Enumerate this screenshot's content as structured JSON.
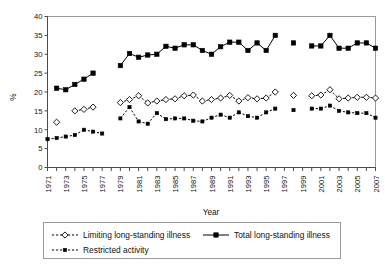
{
  "chart_data": {
    "type": "line",
    "title": "",
    "xlabel": "Year",
    "ylabel": "%",
    "ylim": [
      0,
      40
    ],
    "ytick_step": 5,
    "yticks": [
      0,
      5,
      10,
      15,
      20,
      25,
      30,
      35,
      40
    ],
    "xlim": [
      1971,
      2007
    ],
    "xtick_step": 1,
    "xtick_labels": [
      "1971",
      "1973",
      "1975",
      "1977",
      "1979",
      "1981",
      "1983",
      "1985",
      "1987",
      "1989",
      "1991",
      "1993",
      "1995",
      "1997",
      "1999",
      "2001",
      "2003",
      "2005",
      "2007"
    ],
    "grid": false,
    "legend_position": "bottom",
    "series": [
      {
        "name": "Limiting long-standing illness",
        "marker": "open-diamond",
        "line": "dashed",
        "points": [
          {
            "x": 1972,
            "y": 12.0
          },
          {
            "x": 1974,
            "y": 15.0
          },
          {
            "x": 1975,
            "y": 15.4
          },
          {
            "x": 1976,
            "y": 16.0
          },
          {
            "x": 1979,
            "y": 17.2
          },
          {
            "x": 1980,
            "y": 18.0
          },
          {
            "x": 1981,
            "y": 19.0
          },
          {
            "x": 1982,
            "y": 17.1
          },
          {
            "x": 1983,
            "y": 17.6
          },
          {
            "x": 1984,
            "y": 18.0
          },
          {
            "x": 1985,
            "y": 18.2
          },
          {
            "x": 1986,
            "y": 19.0
          },
          {
            "x": 1987,
            "y": 19.2
          },
          {
            "x": 1988,
            "y": 17.6
          },
          {
            "x": 1989,
            "y": 18.0
          },
          {
            "x": 1990,
            "y": 18.4
          },
          {
            "x": 1991,
            "y": 19.1
          },
          {
            "x": 1992,
            "y": 17.6
          },
          {
            "x": 1993,
            "y": 18.5
          },
          {
            "x": 1994,
            "y": 18.2
          },
          {
            "x": 1995,
            "y": 18.4
          },
          {
            "x": 1996,
            "y": 20.0
          },
          {
            "x": 1998,
            "y": 19.1
          },
          {
            "x": 2000,
            "y": 19.0
          },
          {
            "x": 2001,
            "y": 19.2
          },
          {
            "x": 2002,
            "y": 20.6
          },
          {
            "x": 2003,
            "y": 18.2
          },
          {
            "x": 2004,
            "y": 18.4
          },
          {
            "x": 2005,
            "y": 18.6
          },
          {
            "x": 2006,
            "y": 18.6
          },
          {
            "x": 2007,
            "y": 18.4
          }
        ]
      },
      {
        "name": "Total long-standing illness",
        "marker": "filled-square",
        "line": "solid",
        "points": [
          {
            "x": 1972,
            "y": 21.0
          },
          {
            "x": 1973,
            "y": 20.6
          },
          {
            "x": 1974,
            "y": 22.0
          },
          {
            "x": 1975,
            "y": 23.4
          },
          {
            "x": 1976,
            "y": 25.0
          },
          {
            "x": 1979,
            "y": 27.0
          },
          {
            "x": 1980,
            "y": 30.2
          },
          {
            "x": 1981,
            "y": 29.2
          },
          {
            "x": 1982,
            "y": 29.8
          },
          {
            "x": 1983,
            "y": 30.0
          },
          {
            "x": 1984,
            "y": 32.1
          },
          {
            "x": 1985,
            "y": 31.6
          },
          {
            "x": 1986,
            "y": 32.5
          },
          {
            "x": 1987,
            "y": 32.5
          },
          {
            "x": 1988,
            "y": 31.0
          },
          {
            "x": 1989,
            "y": 30.0
          },
          {
            "x": 1990,
            "y": 32.0
          },
          {
            "x": 1991,
            "y": 33.2
          },
          {
            "x": 1992,
            "y": 33.2
          },
          {
            "x": 1993,
            "y": 31.0
          },
          {
            "x": 1994,
            "y": 33.0
          },
          {
            "x": 1995,
            "y": 31.0
          },
          {
            "x": 1996,
            "y": 35.0
          },
          {
            "x": 1998,
            "y": 33.0
          },
          {
            "x": 2000,
            "y": 32.2
          },
          {
            "x": 2001,
            "y": 32.2
          },
          {
            "x": 2002,
            "y": 35.0
          },
          {
            "x": 2003,
            "y": 31.6
          },
          {
            "x": 2004,
            "y": 31.6
          },
          {
            "x": 2005,
            "y": 33.0
          },
          {
            "x": 2006,
            "y": 33.0
          },
          {
            "x": 2007,
            "y": 31.6
          }
        ]
      },
      {
        "name": "Restricted activity",
        "marker": "small-filled",
        "line": "dashed",
        "points": [
          {
            "x": 1971,
            "y": 7.5
          },
          {
            "x": 1972,
            "y": 7.8
          },
          {
            "x": 1973,
            "y": 8.2
          },
          {
            "x": 1974,
            "y": 8.6
          },
          {
            "x": 1975,
            "y": 10.0
          },
          {
            "x": 1976,
            "y": 9.5
          },
          {
            "x": 1977,
            "y": 9.0
          },
          {
            "x": 1979,
            "y": 13.0
          },
          {
            "x": 1980,
            "y": 16.0
          },
          {
            "x": 1981,
            "y": 12.2
          },
          {
            "x": 1982,
            "y": 11.6
          },
          {
            "x": 1983,
            "y": 14.4
          },
          {
            "x": 1984,
            "y": 12.8
          },
          {
            "x": 1985,
            "y": 13.0
          },
          {
            "x": 1986,
            "y": 13.0
          },
          {
            "x": 1987,
            "y": 12.4
          },
          {
            "x": 1988,
            "y": 12.2
          },
          {
            "x": 1989,
            "y": 13.2
          },
          {
            "x": 1990,
            "y": 14.0
          },
          {
            "x": 1991,
            "y": 13.2
          },
          {
            "x": 1992,
            "y": 14.6
          },
          {
            "x": 1993,
            "y": 13.6
          },
          {
            "x": 1994,
            "y": 13.2
          },
          {
            "x": 1995,
            "y": 14.6
          },
          {
            "x": 1996,
            "y": 15.6
          },
          {
            "x": 1998,
            "y": 15.2
          },
          {
            "x": 2000,
            "y": 15.6
          },
          {
            "x": 2001,
            "y": 15.6
          },
          {
            "x": 2002,
            "y": 16.4
          },
          {
            "x": 2003,
            "y": 15.0
          },
          {
            "x": 2004,
            "y": 14.6
          },
          {
            "x": 2005,
            "y": 14.4
          },
          {
            "x": 2006,
            "y": 14.4
          },
          {
            "x": 2007,
            "y": 13.2
          }
        ]
      }
    ],
    "legend": [
      {
        "label": "Limiting long-standing illness",
        "marker": "open-diamond",
        "line": "dashed"
      },
      {
        "label": "Total long-standing illness",
        "marker": "filled-square",
        "line": "solid"
      },
      {
        "label": "Restricted activity",
        "marker": "small-filled",
        "line": "dashed"
      }
    ]
  }
}
